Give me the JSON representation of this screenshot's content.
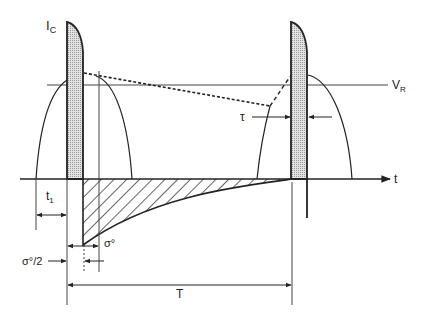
{
  "diagram": {
    "labels": {
      "y_axis": "I",
      "y_axis_sub": "C",
      "x_axis": "t",
      "reference_line": "V",
      "reference_line_sub": "R",
      "tau": "τ",
      "t1": "t",
      "t1_sub": "1",
      "sigma": "σ°",
      "sigma_half": "σ°/2",
      "period": "T"
    },
    "colors": {
      "line": "#222222",
      "pulse_fill": "#c8c8c8",
      "background": "#ffffff"
    }
  }
}
